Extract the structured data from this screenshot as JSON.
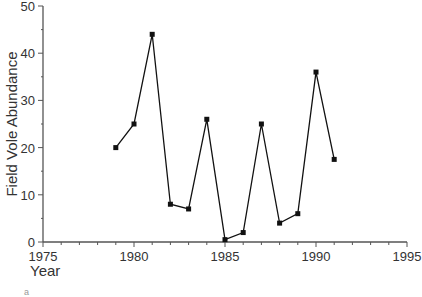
{
  "chart_data": {
    "type": "line",
    "title": "",
    "xlabel": "Year",
    "ylabel": "Field Vole Abundance",
    "xlim": [
      1975,
      1995
    ],
    "ylim": [
      0,
      50
    ],
    "x_ticks": [
      1975,
      1980,
      1985,
      1990,
      1995
    ],
    "y_ticks": [
      0,
      10,
      20,
      30,
      40,
      50
    ],
    "grid": false,
    "legend": null,
    "series": [
      {
        "name": "Field Vole Abundance",
        "marker": "square",
        "color": "#111111",
        "x": [
          1979,
          1980,
          1981,
          1982,
          1983,
          1984,
          1985,
          1986,
          1987,
          1988,
          1989,
          1990,
          1991
        ],
        "values": [
          20,
          25,
          44,
          8,
          7,
          26,
          0.5,
          2,
          25,
          4,
          6,
          36,
          17.5
        ]
      }
    ]
  },
  "labels": {
    "x_title": "Year",
    "y_title": "Field Vole Abundance",
    "x_ticks": [
      "1975",
      "1980",
      "1985",
      "1990",
      "1995"
    ],
    "y_ticks": [
      "0",
      "10",
      "20",
      "30",
      "40",
      "50"
    ],
    "partial_glyph": "a"
  },
  "colors": {
    "axis": "#555555",
    "line": "#111111",
    "marker": "#111111",
    "text": "#333333"
  }
}
